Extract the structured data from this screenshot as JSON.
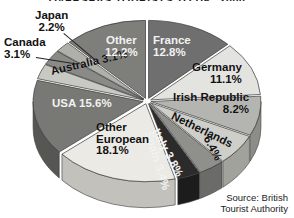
{
  "title": "OVERSEAS TOURISTS TO UK: 2000",
  "source": {
    "line1": "Source: British",
    "line2": "Tourist Authority"
  },
  "chart_data": {
    "type": "pie",
    "title": "OVERSEAS TOURISTS TO UK: 2000",
    "xlabel": "",
    "ylabel": "",
    "unit": "%",
    "legend": "none",
    "grid": false,
    "style": "3d-exploded-grayscale",
    "start_angle_deg": 0,
    "direction": "clockwise",
    "categories": [
      "France",
      "Germany",
      "Irish Republic",
      "Netherlands",
      "Italy",
      "Spain",
      "Other European",
      "USA",
      "Australia",
      "Canada",
      "Japan",
      "Other"
    ],
    "values": [
      12.8,
      11.1,
      8.2,
      6.4,
      3.8,
      3.4,
      18.1,
      15.6,
      3.1,
      3.1,
      2.2,
      12.2
    ],
    "slices": [
      {
        "label": "France",
        "value": 12.8,
        "text": "France",
        "pct_text": "12.8%",
        "color": "#6f6f6f",
        "side_color": "#4f4f4f"
      },
      {
        "label": "Germany",
        "value": 11.1,
        "text": "Germany",
        "pct_text": "11.1%",
        "color": "#e3e3e0",
        "side_color": "#b6b6b2"
      },
      {
        "label": "Irish Republic",
        "value": 8.2,
        "text": "Irish Republic",
        "pct_text": "8.2%",
        "color": "#b4b4b0",
        "side_color": "#8c8c88"
      },
      {
        "label": "Netherlands",
        "value": 6.4,
        "text": "Netherlands",
        "pct_text": "6.4%",
        "color": "#cfcfca",
        "side_color": "#a2a29d"
      },
      {
        "label": "Italy",
        "value": 3.8,
        "text": "Italy",
        "pct_text": "3.8%",
        "color": "#8f8f8b",
        "side_color": "#6b6b68"
      },
      {
        "label": "Spain",
        "value": 3.4,
        "text": "Spain",
        "pct_text": "3.4%",
        "color": "#2b2b2b",
        "side_color": "#1c1c1c"
      },
      {
        "label": "Other European",
        "value": 18.1,
        "text": "Other European",
        "pct_text": "18.1%",
        "color": "#eceae4",
        "side_color": "#c3c1bb"
      },
      {
        "label": "USA",
        "value": 15.6,
        "text": "USA",
        "pct_text": "15.6%",
        "color": "#787874",
        "side_color": "#565652"
      },
      {
        "label": "Australia",
        "value": 3.1,
        "text": "Australia",
        "pct_text": "3.1%",
        "color": "#c9c9c4",
        "side_color": "#9c9c97"
      },
      {
        "label": "Canada",
        "value": 3.1,
        "text": "Canada",
        "pct_text": "3.1%",
        "color": "#8a8a86",
        "side_color": "#666662"
      },
      {
        "label": "Japan",
        "value": 2.2,
        "text": "Japan",
        "pct_text": "2.2%",
        "color": "#b0b0ab",
        "side_color": "#85857f"
      },
      {
        "label": "Other",
        "value": 12.2,
        "text": "Other",
        "pct_text": "12.2%",
        "color": "#7e7e7a",
        "side_color": "#5b5b57"
      }
    ]
  },
  "labels": {
    "japan_name": "Japan",
    "japan_pct": "2.2%",
    "canada_name": "Canada",
    "canada_pct": "3.1%",
    "australia": "Australia 3.1%",
    "usa": "USA 15.6%",
    "other_name": "Other",
    "other_pct": "12.2%",
    "france_name": "France",
    "france_pct": "12.8%",
    "germany_name": "Germany",
    "germany_pct": "11.1%",
    "irish_name": "Irish Republic",
    "irish_pct": "8.2%",
    "netherlands": "Netherlands",
    "netherlands_pct": "6.4%",
    "italy": "Italy 3.8%",
    "spain": "Spain 3.4%",
    "othereuro_l1": "Other",
    "othereuro_l2": "European",
    "othereuro_pct": "18.1%"
  }
}
